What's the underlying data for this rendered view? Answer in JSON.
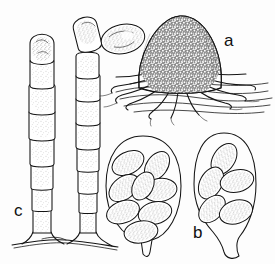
{
  "figure": {
    "background_color": "#fdfdfd",
    "ink_color": "#141414",
    "stipple_color": "#8a8a8a",
    "width": 275,
    "height": 264
  },
  "labels": [
    {
      "id": "a",
      "text": "a",
      "x": 224,
      "y": 46,
      "refers_to": "sporocarp-with-rhizoids"
    },
    {
      "id": "b",
      "text": "b",
      "x": 193,
      "y": 238,
      "refers_to": "ascus-right"
    },
    {
      "id": "c",
      "text": "c",
      "x": 14,
      "y": 216,
      "refers_to": "arthrospore-chains"
    }
  ],
  "panels": [
    {
      "key": "a",
      "name": "sporocarp-with-rhizoids",
      "caption_letter": "a",
      "structure": "globose warty fruiting body seated on a mat of hyphae, anchored by branching rhizoids",
      "center": {
        "x": 180,
        "y": 58
      },
      "radius": 42,
      "surface_texture": "reticulate-warty",
      "rhizoid_count": 11,
      "substrate_hypha_lines": 7
    },
    {
      "key": "b",
      "name": "asci-with-ascospores",
      "caption_letter": "b",
      "asci": [
        {
          "name": "ascus-left",
          "outline_center": {
            "x": 143,
            "y": 190
          },
          "width": 74,
          "height": 104,
          "stalked": true,
          "spore_count": 8,
          "spore_shape": "ellipsoidal"
        },
        {
          "name": "ascus-right",
          "outline_center": {
            "x": 224,
            "y": 188
          },
          "width": 64,
          "height": 110,
          "stalked": true,
          "spore_count": 5,
          "spore_shape": "ellipsoidal"
        }
      ]
    },
    {
      "key": "c",
      "name": "arthrospore-chains",
      "caption_letter": "c",
      "chains": [
        {
          "name": "chain-left",
          "x": 42,
          "top_y": 26,
          "bottom_y": 232,
          "segment_count": 8,
          "terminal_cell": "rounded"
        },
        {
          "name": "chain-right",
          "x": 88,
          "top_y": 22,
          "bottom_y": 232,
          "segment_count": 9,
          "terminal_cell": "oblique-rounded"
        }
      ],
      "basal_hypha": {
        "name": "basal-hypha",
        "y": 244,
        "x_start": 12,
        "x_end": 118
      }
    }
  ],
  "free_spore": {
    "name": "detached-spore",
    "center": {
      "x": 123,
      "y": 39
    },
    "rx": 22,
    "ry": 14,
    "rotation_deg": -12,
    "shape": "ellipsoidal"
  }
}
